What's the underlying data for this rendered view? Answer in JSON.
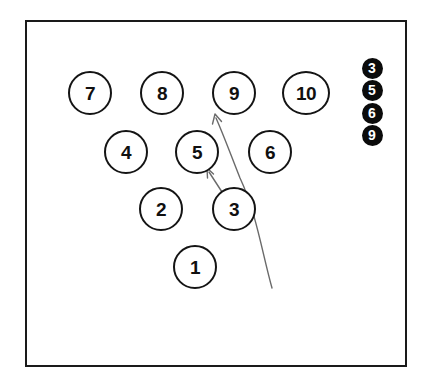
{
  "diagram": {
    "type": "bowling-pin-deck",
    "background_color": "#ffffff",
    "frame": {
      "stroke_color": "#1a1a1a",
      "x": 25,
      "y": 20,
      "width": 382,
      "height": 347
    },
    "pin_style": {
      "fill": "#ffffff",
      "stroke": "#141414",
      "text_color": "#101010",
      "diameter": 44
    },
    "pins": [
      {
        "label": "7",
        "row": 4,
        "cx": 90,
        "cy": 93,
        "wide": false
      },
      {
        "label": "8",
        "row": 4,
        "cx": 162,
        "cy": 93,
        "wide": false
      },
      {
        "label": "9",
        "row": 4,
        "cx": 234,
        "cy": 93,
        "wide": false
      },
      {
        "label": "10",
        "row": 4,
        "cx": 306,
        "cy": 93,
        "wide": true
      },
      {
        "label": "4",
        "row": 3,
        "cx": 126,
        "cy": 152,
        "wide": false
      },
      {
        "label": "5",
        "row": 3,
        "cx": 197,
        "cy": 152,
        "wide": false
      },
      {
        "label": "6",
        "row": 3,
        "cx": 270,
        "cy": 152,
        "wide": false
      },
      {
        "label": "2",
        "row": 2,
        "cx": 161,
        "cy": 209,
        "wide": false
      },
      {
        "label": "3",
        "row": 2,
        "cx": 234,
        "cy": 209,
        "wide": false
      },
      {
        "label": "1",
        "row": 1,
        "cx": 195,
        "cy": 267,
        "wide": false
      }
    ],
    "badges": {
      "fill": "#0b0b0b",
      "text_color": "#ffffff",
      "items": [
        {
          "label": "3",
          "cx": 372,
          "cy": 68
        },
        {
          "label": "5",
          "cx": 372,
          "cy": 90
        },
        {
          "label": "6",
          "cx": 372,
          "cy": 113
        },
        {
          "label": "9",
          "cx": 372,
          "cy": 135
        }
      ]
    },
    "arrows": {
      "stroke_color": "#6a6a6a",
      "items": [
        {
          "name": "ball-path-arrow",
          "path": "M 272 288 C 262 252, 256 212, 240 178 C 232 158, 224 136, 216 118",
          "head_tip_x": 215,
          "head_tip_y": 114
        },
        {
          "name": "pin-deflection-arrow",
          "path": "M 222 192 L 209 172",
          "head_tip_x": 207,
          "head_tip_y": 168
        }
      ]
    }
  }
}
